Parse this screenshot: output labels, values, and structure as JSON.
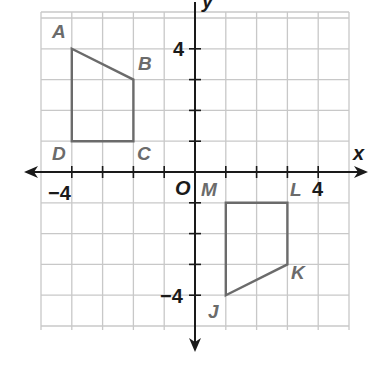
{
  "diagram": {
    "type": "coordinate-plane",
    "axes": {
      "x_label": "x",
      "y_label": "y",
      "origin_label": "O"
    },
    "tick_labels": {
      "x_neg": "−4",
      "x_pos": "4",
      "y_pos": "4",
      "y_neg": "−4"
    },
    "grid": {
      "xmin": -5,
      "xmax": 5,
      "ymin": -5,
      "ymax": 5
    },
    "colors": {
      "grid": "#c8c8c8",
      "axis": "#1a1a1a",
      "shape": "#6b6b6b",
      "label": "#6b6b6b"
    },
    "figures": [
      {
        "name": "ABCD",
        "vertices": [
          {
            "label": "A",
            "x": -4,
            "y": 4
          },
          {
            "label": "B",
            "x": -2,
            "y": 3
          },
          {
            "label": "C",
            "x": -2,
            "y": 1
          },
          {
            "label": "D",
            "x": -4,
            "y": 1
          }
        ]
      },
      {
        "name": "JKLM",
        "vertices": [
          {
            "label": "J",
            "x": 1,
            "y": -4
          },
          {
            "label": "K",
            "x": 3,
            "y": -3
          },
          {
            "label": "L",
            "x": 3,
            "y": -1
          },
          {
            "label": "M",
            "x": 1,
            "y": -1
          }
        ]
      }
    ]
  }
}
